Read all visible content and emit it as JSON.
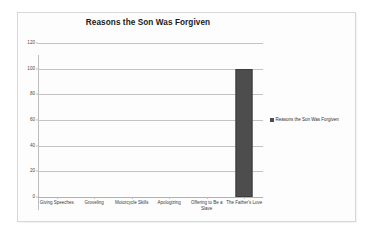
{
  "chart_data": {
    "type": "bar",
    "title": "Reasons the Son Was Forgiven",
    "xlabel": "",
    "ylabel": "",
    "categories": [
      "Giving Speeches",
      "Groveling",
      "Motorcycle Skills",
      "Apologizing",
      "Offering to Be a Slave",
      "The Father's Love"
    ],
    "values": [
      0,
      0,
      0,
      0,
      0,
      100
    ],
    "ylim": [
      0,
      120
    ],
    "yticks": [
      0,
      20,
      40,
      60,
      80,
      100,
      120
    ],
    "ytick_labels": [
      "0",
      "20",
      "40",
      "60",
      "80",
      "100",
      "120"
    ],
    "grid": true,
    "legend": {
      "position": "right",
      "entries": [
        {
          "label": "Reasons the Son Was Forgiven",
          "color": "#4d4d4d"
        }
      ]
    },
    "series": [
      {
        "name": "Reasons the Son Was Forgiven",
        "color": "#4d4d4d",
        "values": [
          0,
          0,
          0,
          0,
          0,
          100
        ]
      }
    ]
  },
  "colors": {
    "bar": "#4d4d4d",
    "gridline": "#c4c4c4",
    "axis": "#bdbdbd",
    "frame_border": "#d8d8d8",
    "background": "#fdfdfd",
    "title_text": "#1a1a1a",
    "tick_text": "#4a4a4a"
  }
}
